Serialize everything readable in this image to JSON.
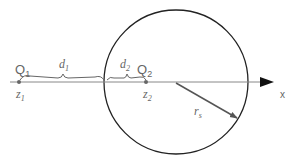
{
  "diagram": {
    "axis_label": "x",
    "charges": [
      {
        "name": "Q",
        "sub": "1",
        "position_label": "z",
        "position_sub": "1"
      },
      {
        "name": "Q",
        "sub": "2",
        "position_label": "z",
        "position_sub": "2"
      }
    ],
    "distances": [
      {
        "label": "d",
        "sub": "1"
      },
      {
        "label": "d",
        "sub": "2"
      }
    ],
    "radius": {
      "label": "r",
      "sub": "s"
    },
    "colors": {
      "line": "#777777",
      "circle": "#222222",
      "arrow": "#555555",
      "text": "#666666"
    }
  }
}
